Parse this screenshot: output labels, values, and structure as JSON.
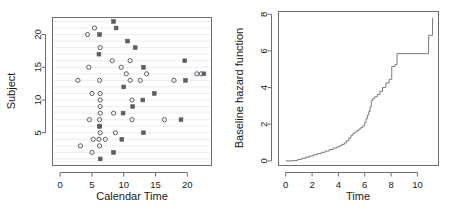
{
  "figure": {
    "title": "",
    "panel_count": 2
  },
  "chart_data": [
    {
      "id": "calendar-time-subject-scatter",
      "type": "scatter",
      "title": "",
      "xlabel": "Calendar Time",
      "ylabel": "Subject",
      "xlim": [
        -1.2,
        23.8
      ],
      "ylim": [
        0.0,
        22.6
      ],
      "xticks": [
        0,
        5,
        10,
        15,
        20
      ],
      "yticks": [
        5,
        10,
        15,
        20
      ],
      "xticklabels": [
        "0",
        "5",
        "10",
        "15",
        "20"
      ],
      "yticklabels": [
        "5",
        "10",
        "15",
        "20"
      ],
      "grid": "horizontal-light",
      "legend": null,
      "marker_note": "open circles = censored / observation, filled squares = event",
      "series": [
        {
          "name": "open",
          "marker": "open-circle",
          "color": "#5d5d68",
          "points": [
            [
              5.4,
              21.0
            ],
            [
              4.3,
              20.0
            ],
            [
              6.3,
              18.0
            ],
            [
              4.5,
              15.0
            ],
            [
              8.2,
              16.0
            ],
            [
              11.0,
              16.0
            ],
            [
              9.6,
              15.0
            ],
            [
              10.4,
              14.0
            ],
            [
              13.6,
              14.0
            ],
            [
              21.5,
              14.0
            ],
            [
              22.2,
              14.0
            ],
            [
              2.8,
              13.0
            ],
            [
              6.2,
              13.0
            ],
            [
              11.0,
              13.0
            ],
            [
              12.6,
              13.0
            ],
            [
              17.9,
              13.0
            ],
            [
              5.0,
              11.0
            ],
            [
              6.3,
              11.0
            ],
            [
              6.3,
              10.0
            ],
            [
              11.3,
              10.0
            ],
            [
              6.3,
              9.0
            ],
            [
              6.3,
              8.0
            ],
            [
              8.4,
              8.0
            ],
            [
              11.3,
              7.0
            ],
            [
              16.4,
              7.0
            ],
            [
              4.6,
              7.0
            ],
            [
              6.2,
              7.0
            ],
            [
              6.2,
              6.0
            ],
            [
              6.3,
              5.0
            ],
            [
              8.7,
              5.0
            ],
            [
              5.2,
              4.0
            ],
            [
              6.1,
              4.0
            ],
            [
              7.1,
              4.0
            ],
            [
              3.2,
              3.0
            ],
            [
              6.2,
              3.0
            ],
            [
              5.0,
              2.0
            ]
          ]
        },
        {
          "name": "filled",
          "marker": "filled-square",
          "color": "#5d5d68",
          "points": [
            [
              8.4,
              22.0
            ],
            [
              8.8,
              21.0
            ],
            [
              6.2,
              20.0
            ],
            [
              10.6,
              19.0
            ],
            [
              11.8,
              18.0
            ],
            [
              6.1,
              17.0
            ],
            [
              19.6,
              16.0
            ],
            [
              13.1,
              15.0
            ],
            [
              22.6,
              14.0
            ],
            [
              19.7,
              13.0
            ],
            [
              10.0,
              12.0
            ],
            [
              14.8,
              11.0
            ],
            [
              13.0,
              10.0
            ],
            [
              11.4,
              9.0
            ],
            [
              9.9,
              8.0
            ],
            [
              19.0,
              7.0
            ],
            [
              6.2,
              6.0
            ],
            [
              13.1,
              5.0
            ],
            [
              9.7,
              4.0
            ],
            [
              8.4,
              2.0
            ],
            [
              6.3,
              1.0
            ]
          ]
        }
      ]
    },
    {
      "id": "baseline-hazard-step",
      "type": "line",
      "subtype": "step",
      "title": "",
      "xlabel": "Time",
      "ylabel": "Baseline hazard function",
      "xlim": [
        -0.55,
        11.6
      ],
      "ylim": [
        -0.25,
        8.15
      ],
      "xticks": [
        0,
        2,
        4,
        6,
        8,
        10
      ],
      "yticks": [
        0,
        2,
        4,
        6,
        8
      ],
      "xticklabels": [
        "0",
        "2",
        "4",
        "6",
        "8",
        "10"
      ],
      "yticklabels": [
        "0",
        "2",
        "4",
        "6",
        "8"
      ],
      "grid": "none",
      "legend": null,
      "series": [
        {
          "name": "cumulative baseline hazard",
          "color": "#7a7a7a",
          "x": [
            0.0,
            0.55,
            0.9,
            1.2,
            1.5,
            1.8,
            2.1,
            2.4,
            2.7,
            3.0,
            3.3,
            3.6,
            3.85,
            4.05,
            4.25,
            4.45,
            4.6,
            4.8,
            4.95,
            5.1,
            5.25,
            5.4,
            5.55,
            5.7,
            5.85,
            6.0,
            6.1,
            6.2,
            6.3,
            6.4,
            6.5,
            6.6,
            6.75,
            6.95,
            7.15,
            7.35,
            7.6,
            7.85,
            8.05,
            8.3,
            8.45,
            10.6,
            10.85,
            11.0,
            11.15
          ],
          "y": [
            0.0,
            0.02,
            0.08,
            0.14,
            0.2,
            0.27,
            0.34,
            0.4,
            0.47,
            0.54,
            0.62,
            0.7,
            0.76,
            0.82,
            0.9,
            0.98,
            1.1,
            1.25,
            1.4,
            1.5,
            1.58,
            1.66,
            1.74,
            1.82,
            1.92,
            2.1,
            2.3,
            2.5,
            2.7,
            2.95,
            3.3,
            3.4,
            3.5,
            3.62,
            3.8,
            4.0,
            4.25,
            4.45,
            5.15,
            5.25,
            5.85,
            5.85,
            6.85,
            6.85,
            7.8
          ]
        }
      ]
    }
  ]
}
